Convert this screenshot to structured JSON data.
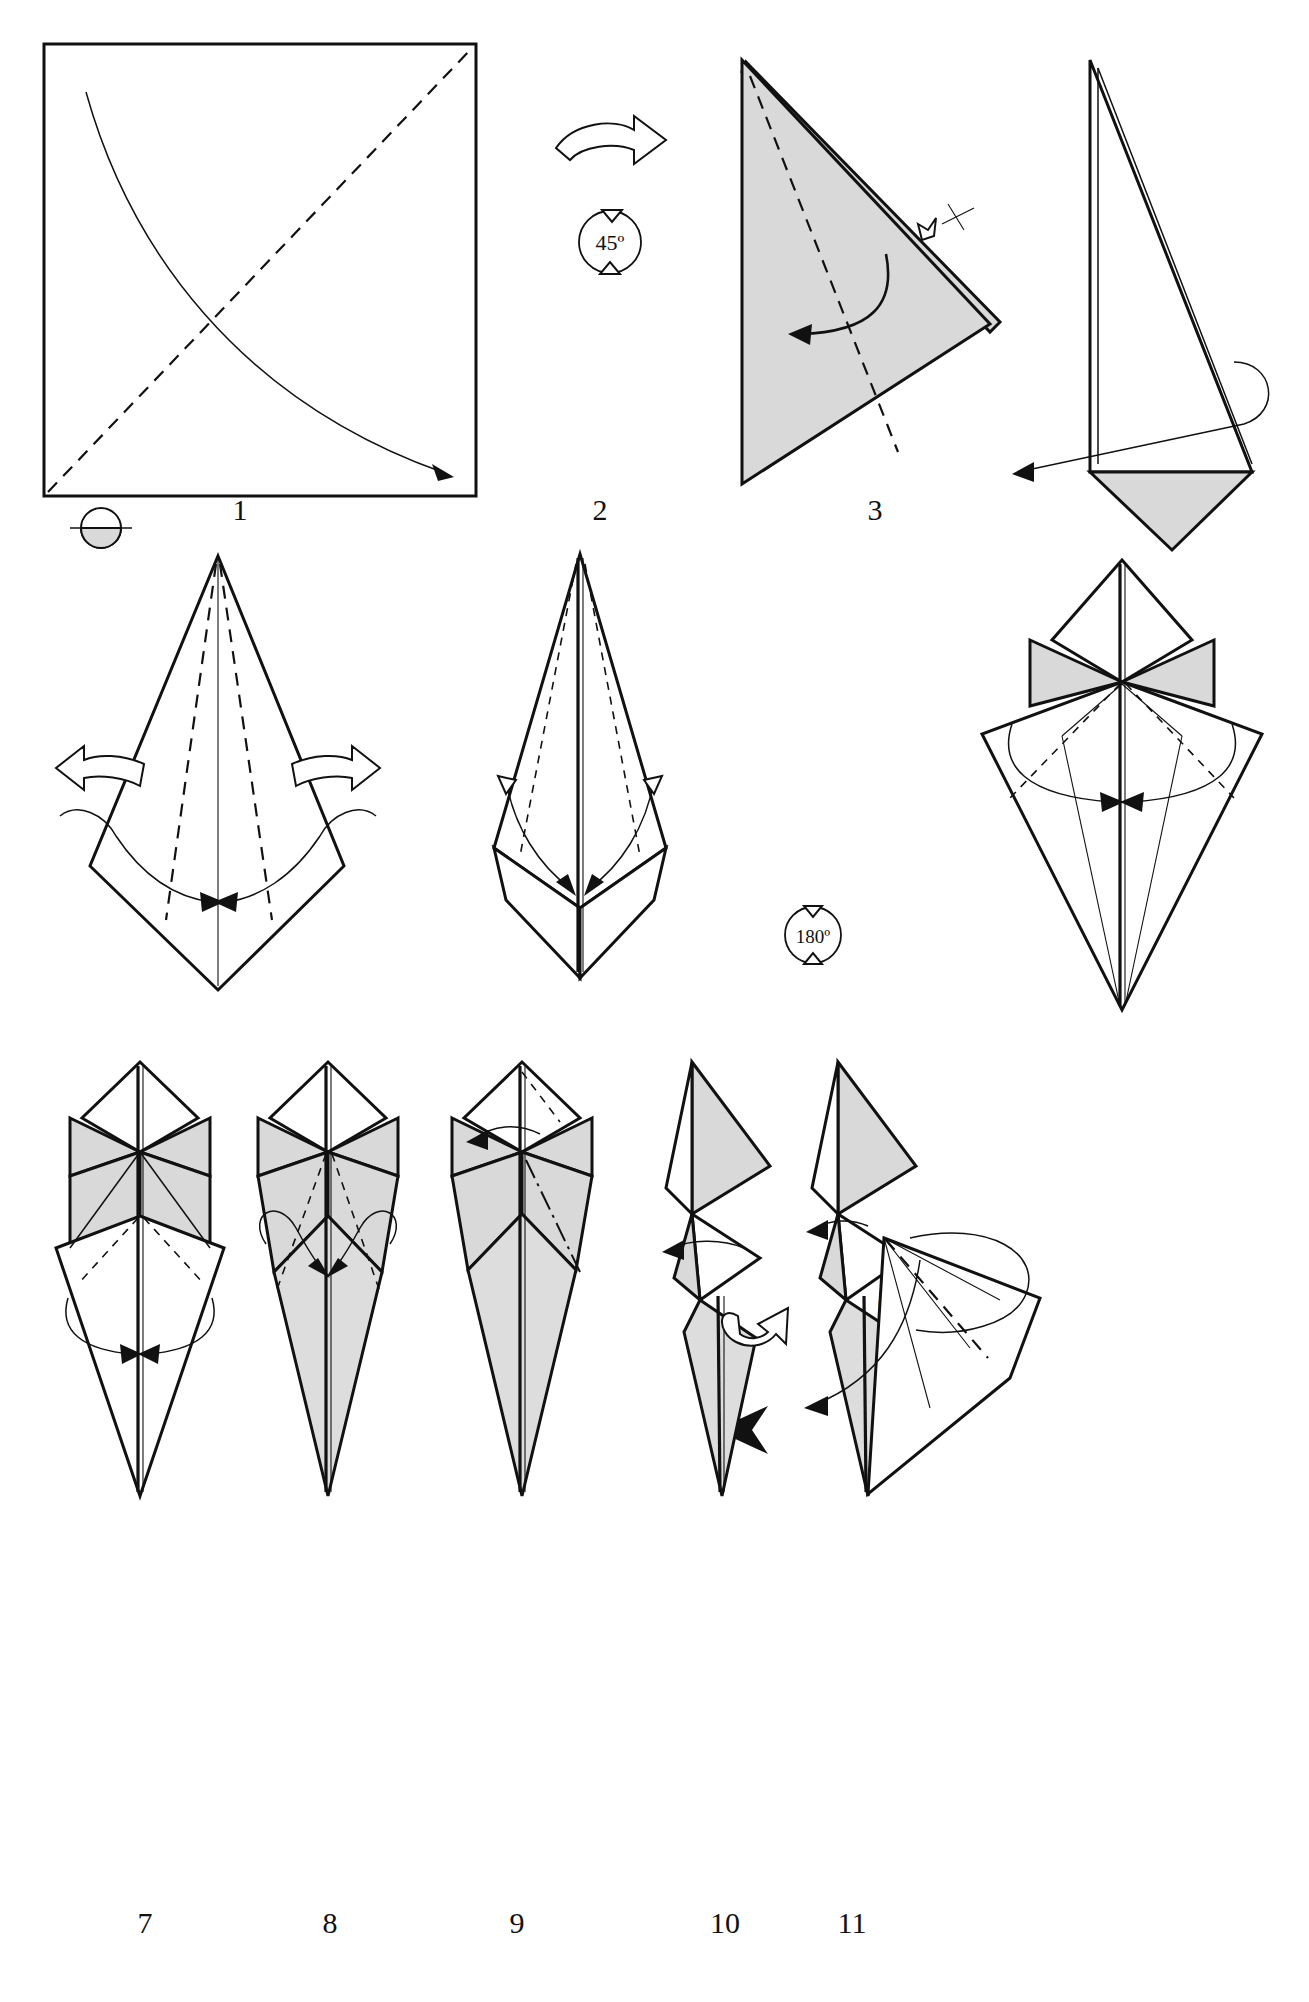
{
  "document": {
    "type": "origami-folding-diagram",
    "total_steps": 11,
    "page_background": "#ffffff",
    "paper_front_color": "#ffffff",
    "paper_back_color": "#d9d9d9",
    "line_color": "#111111"
  },
  "symbols": {
    "rotate_45": "45º",
    "rotate_180": "180º",
    "paper_key_name": "paper-color-key",
    "turn_over_name": "turn-over-arrow",
    "flip_pointer_name": "flip-pointer-arrow"
  },
  "steps": [
    {
      "number": "1",
      "label": "1",
      "name": "step-1-square-base",
      "annotations": [
        "rotate-45",
        "turn-over-arrow",
        "paper-color-key"
      ]
    },
    {
      "number": "2",
      "label": "2",
      "name": "step-2-triangle-fold",
      "annotations": [
        "valley-fold",
        "fold-arrow",
        "x-marker"
      ]
    },
    {
      "number": "3",
      "label": "3",
      "name": "step-3-narrow-triangle",
      "annotations": [
        "wrap-around-arrow"
      ]
    },
    {
      "number": "4",
      "label": "4",
      "name": "step-4-kite-open",
      "annotations": [
        "two-hollow-arrows",
        "petal-arrows"
      ]
    },
    {
      "number": "5",
      "label": "5",
      "name": "step-5-preliminary-shape",
      "annotations": [
        "rotate-180",
        "inside-reverse-arrows"
      ]
    },
    {
      "number": "6",
      "label": "6",
      "name": "step-6-bird-base",
      "annotations": [
        "inward-fold-arrows"
      ]
    },
    {
      "number": "7",
      "label": "7",
      "name": "step-7-narrowed-base",
      "annotations": [
        "inward-fold-arrows"
      ]
    },
    {
      "number": "8",
      "label": "8",
      "name": "step-8-folded-flaps",
      "annotations": [
        "double-loop-arrows"
      ]
    },
    {
      "number": "9",
      "label": "9",
      "name": "step-9-mountain-fold",
      "annotations": [
        "mountain-fold",
        "flip-pointer-arrow"
      ]
    },
    {
      "number": "10",
      "label": "10",
      "name": "step-10-side-view",
      "annotations": [
        "pull-arrow",
        "hollow-twist-arrow"
      ]
    },
    {
      "number": "11",
      "label": "11",
      "name": "step-11-final-shaping",
      "annotations": [
        "swivel-arrows",
        "valley-fold"
      ]
    }
  ]
}
